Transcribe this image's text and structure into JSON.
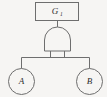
{
  "diagram": {
    "type": "fault-tree",
    "background_color": "#f6f5f3",
    "stroke_color": "#6e6e6e",
    "text_color": "#2e2e2e",
    "top_event": {
      "shape": "rectangle",
      "label_main": "G",
      "label_sub": "1",
      "label_full": "G1"
    },
    "gate": {
      "shape": "and-gate",
      "label": "AND"
    },
    "basic_events": [
      {
        "shape": "circle",
        "label": "A"
      },
      {
        "shape": "circle",
        "label": "B"
      }
    ]
  }
}
